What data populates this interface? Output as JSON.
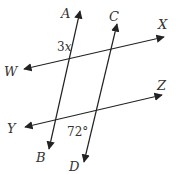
{
  "diagram": {
    "type": "parallel lines cut by transversals",
    "lines": [
      {
        "name": "AB",
        "start_label": "A",
        "end_label": "B",
        "x1": 80,
        "y1": 11,
        "x2": 49,
        "y2": 149
      },
      {
        "name": "CD",
        "start_label": "C",
        "end_label": "D",
        "x1": 117,
        "y1": 24,
        "x2": 84,
        "y2": 162
      },
      {
        "name": "WX",
        "start_label": "W",
        "end_label": "X",
        "x1": 24,
        "y1": 69,
        "x2": 164,
        "y2": 37
      },
      {
        "name": "YZ",
        "start_label": "Y",
        "end_label": "Z",
        "x1": 25,
        "y1": 127,
        "x2": 162,
        "y2": 95
      }
    ],
    "labels": {
      "A": "A",
      "B": "B",
      "C": "C",
      "D": "D",
      "W": "W",
      "X": "X",
      "Y": "Y",
      "Z": "Z"
    },
    "angles": {
      "angle_1": {
        "coefficient": "3",
        "variable": "x",
        "location": "upper-left of intersection of AB and WX"
      },
      "angle_2": {
        "value": "72°",
        "location": "lower-left of intersection of CD and YZ"
      }
    },
    "colors": {
      "line": "#222222",
      "text": "#333333",
      "background": "#ffffff"
    }
  }
}
